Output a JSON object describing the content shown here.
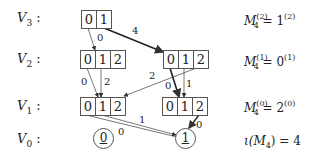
{
  "levels": [
    {
      "label": "V",
      "sub": "3",
      "suffix": " :"
    },
    {
      "label": "V",
      "sub": "2",
      "suffix": " :"
    },
    {
      "label": "V",
      "sub": "1",
      "suffix": " :"
    },
    {
      "label": "V",
      "sub": "0",
      "suffix": " :"
    }
  ],
  "nodes": {
    "v3": [
      "0",
      "1"
    ],
    "v2_left": [
      "0",
      "1",
      "2"
    ],
    "v2_right": [
      "0",
      "1",
      "2"
    ],
    "v1_left": [
      "0",
      "1",
      "2"
    ],
    "v1_right": [
      "0",
      "1",
      "2"
    ],
    "v0_left": "0",
    "v0_right": "1"
  },
  "edge_labels": {
    "v3_0_to_v2_left": "0",
    "v3_1_to_v2_right": "4",
    "v2_left_0": "0",
    "v2_left_1": "2",
    "v2_right_2_to_v1_left": "2",
    "v2_right_0": "0",
    "v2_right_1": "1",
    "v1_left_to_v0_a": "0",
    "v1_left_to_v0_b": "1",
    "v1_right_2_to_v0": "0"
  },
  "equations": [
    {
      "lhs": "M",
      "lsub": "4",
      "lsup": "(2)",
      "rhs": "1",
      "rsup": "(2)"
    },
    {
      "lhs": "M",
      "lsub": "4",
      "lsup": "(1)",
      "rhs": "0",
      "rsup": "(1)"
    },
    {
      "lhs": "M",
      "lsub": "4",
      "lsup": "(0)",
      "rhs": "2",
      "rsup": "(0)"
    }
  ],
  "iota": {
    "text": "ι(M",
    "sub": "4",
    "rest": ") = 4"
  }
}
